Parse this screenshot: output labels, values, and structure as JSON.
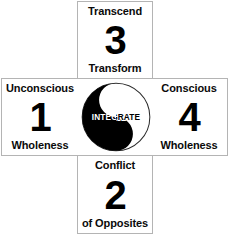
{
  "diagram": {
    "background_color": "#ffffff",
    "border_color": "#b4b4b4",
    "text_color": "#0a0a0a",
    "quadrants": [
      {
        "id": "top",
        "position": "top",
        "caption_top": "Transcend",
        "number": "3",
        "caption_bottom": "Transform"
      },
      {
        "id": "left",
        "position": "left",
        "caption_top": "Unconscious",
        "number": "1",
        "caption_bottom": "Wholeness"
      },
      {
        "id": "right",
        "position": "right",
        "caption_top": "Conscious",
        "number": "4",
        "caption_bottom": "Wholeness"
      },
      {
        "id": "bottom",
        "position": "bottom",
        "caption_top": "Conflict",
        "number": "2",
        "caption_bottom": "of Opposites"
      }
    ],
    "center": {
      "symbol": "yin-yang",
      "label": "INTEGRATE",
      "dark_color": "#000000",
      "light_color": "#ffffff",
      "outline_color": "#2b2b2b"
    }
  }
}
